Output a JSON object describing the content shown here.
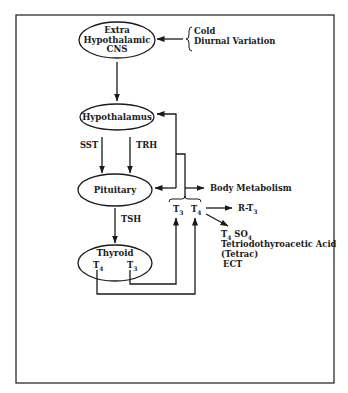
{
  "diagram": {
    "frame": {
      "stroke": "#2b2b2b"
    },
    "nodes": {
      "cns": {
        "lines": [
          "Extra",
          "Hypothalamic",
          "CNS"
        ]
      },
      "hypothalamus": {
        "label": "Hypothalamus"
      },
      "pituitary": {
        "label": "Pituitary"
      },
      "thyroid": {
        "label": "Thyroid",
        "t4": "T",
        "t4_sub": "4",
        "t3": "T",
        "t3_sub": "3"
      }
    },
    "inputs": {
      "brace_items": [
        "Cold",
        "Diurnal Variation"
      ]
    },
    "edge_labels": {
      "sst": "SST",
      "trh": "TRH",
      "tsh": "TSH"
    },
    "hormones": {
      "t3": "T",
      "t3_sub": "3",
      "t4": "T",
      "t4_sub": "4"
    },
    "outputs": {
      "body_metabolism": "Body Metabolism",
      "rt3": "R-T",
      "rt3_sub": "3",
      "t4so4_a": "T",
      "t4so4_a_sub": "4",
      "t4so4_b": " SO",
      "t4so4_b_sub": "4",
      "tetriodo": "Tetriodothyroacetic Acid",
      "tetrac": "(Tetrac)",
      "ect": "ECT"
    }
  }
}
